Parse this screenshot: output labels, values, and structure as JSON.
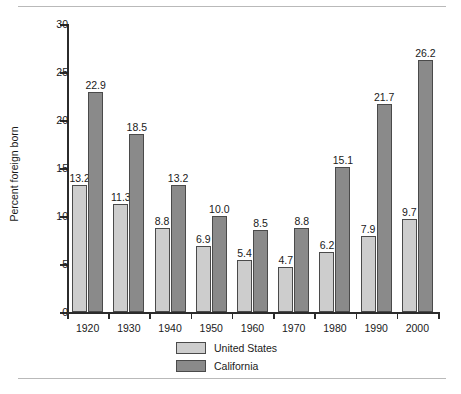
{
  "chart_data": {
    "type": "bar",
    "title": "",
    "xlabel": "",
    "ylabel": "Percent foreign born",
    "ylim": [
      0,
      30
    ],
    "ytick_step": 5,
    "yticks": [
      "0",
      "5",
      "10",
      "15",
      "20",
      "25",
      "30"
    ],
    "grid": false,
    "legend_position": "bottom-center",
    "categories": [
      "1920",
      "1930",
      "1940",
      "1950",
      "1960",
      "1970",
      "1980",
      "1990",
      "2000"
    ],
    "series": [
      {
        "name": "United States",
        "color": "#cdcdcd",
        "values": [
          13.2,
          11.3,
          8.8,
          6.9,
          5.4,
          4.7,
          6.2,
          7.9,
          9.7
        ],
        "labels": [
          "13.2",
          "11.3",
          "8.8",
          "6.9",
          "5.4",
          "4.7",
          "6.2",
          "7.9",
          "9.7"
        ]
      },
      {
        "name": "California",
        "color": "#8a8a8a",
        "values": [
          22.9,
          18.5,
          13.2,
          10.0,
          8.5,
          8.8,
          15.1,
          21.7,
          26.2
        ],
        "labels": [
          "22.9",
          "18.5",
          "13.2",
          "10.0",
          "8.5",
          "8.8",
          "15.1",
          "21.7",
          "26.2"
        ]
      }
    ]
  },
  "legend": {
    "items": [
      {
        "label": "United States",
        "color": "#cdcdcd"
      },
      {
        "label": "California",
        "color": "#8a8a8a"
      }
    ]
  },
  "colors": {
    "united_states": "#cdcdcd",
    "california": "#8a8a8a",
    "axis": "#2b2b2b",
    "bar_outline": "#4a4a4a",
    "page_rule": "#b9b9b9",
    "background": "#ffffff"
  }
}
